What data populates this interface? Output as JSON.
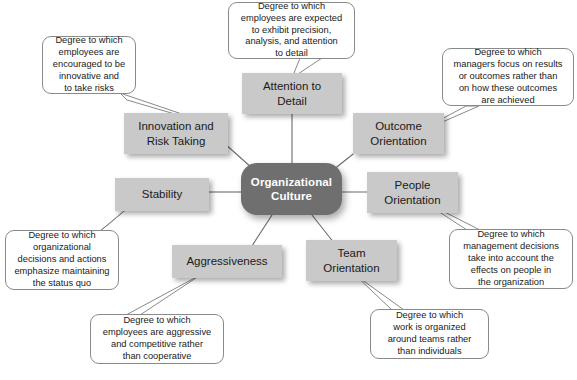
{
  "diagram": {
    "title": "Organizational Culture",
    "center": {
      "label": "Organizational\nCulture",
      "line1": "Organizational",
      "line2": "Culture",
      "fill": "#6f6f6f",
      "text_color": "#ffffff"
    },
    "box_fill": "#c9c9c9",
    "callout_fill": "#ffffff",
    "callout_border": "#8a8a8a",
    "line_color": "#6b6b6b",
    "dimensions": [
      {
        "id": "attention-to-detail",
        "line1": "Attention to",
        "line2": "Detail",
        "description": "Degree to which employees are expected to exhibit precision, analysis, and attention to detail",
        "desc_lines": [
          "Degree to which",
          "employees are expected",
          "to exhibit precision,",
          "analysis, and attention",
          "to detail"
        ]
      },
      {
        "id": "innovation-and-risk-taking",
        "line1": "Innovation and",
        "line2": "Risk Taking",
        "description": "Degree to which employees are encouraged to be innovative and to take risks",
        "desc_lines": [
          "Degree to which",
          "employees are",
          "encouraged to be",
          "innovative and",
          "to take risks"
        ]
      },
      {
        "id": "outcome-orientation",
        "line1": "Outcome",
        "line2": "Orientation",
        "description": "Degree to which managers focus on results or outcomes rather than on how these outcomes are achieved",
        "desc_lines": [
          "Degree to which",
          "managers focus on results",
          "or outcomes rather than",
          "on how these outcomes",
          "are achieved"
        ]
      },
      {
        "id": "people-orientation",
        "line1": "People",
        "line2": "Orientation",
        "description": "Degree to which management decisions take into account the effects on people in the organization",
        "desc_lines": [
          "Degree to which",
          "management decisions",
          "take into account the",
          "effects on people in",
          "the organization"
        ]
      },
      {
        "id": "stability",
        "line1": "Stability",
        "line2": "",
        "description": "Degree to which organizational decisions and actions emphasize maintaining the status quo",
        "desc_lines": [
          "Degree to which",
          "organizational",
          "decisions and actions",
          "emphasize maintaining",
          "the status quo"
        ]
      },
      {
        "id": "aggressiveness",
        "line1": "Aggressiveness",
        "line2": "",
        "description": "Degree to which employees are aggressive and competitive rather than cooperative",
        "desc_lines": [
          "Degree to which",
          "employees are aggressive",
          "and competitive rather",
          "than cooperative"
        ]
      },
      {
        "id": "team-orientation",
        "line1": "Team",
        "line2": "Orientation",
        "description": "Degree to which work is organized around teams rather than individuals",
        "desc_lines": [
          "Degree to which",
          "work is organized",
          "around teams rather",
          "than individuals"
        ]
      }
    ]
  }
}
